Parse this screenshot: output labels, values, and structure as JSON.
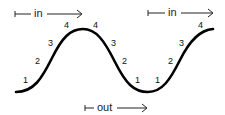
{
  "diagram": {
    "arrows": [
      {
        "id": "in-1",
        "label": "in",
        "direction": "right"
      },
      {
        "id": "in-2",
        "label": "in",
        "direction": "right"
      },
      {
        "id": "out",
        "label": "out",
        "direction": "right"
      }
    ],
    "slope_labels": {
      "rise_1": [
        "1",
        "2",
        "3",
        "4"
      ],
      "fall": [
        "4",
        "3",
        "2",
        "1"
      ],
      "rise_2": [
        "1",
        "2",
        "3",
        "4"
      ]
    },
    "colors": {
      "curve": "#000000",
      "text": "#111111",
      "background": "#ffffff"
    }
  }
}
